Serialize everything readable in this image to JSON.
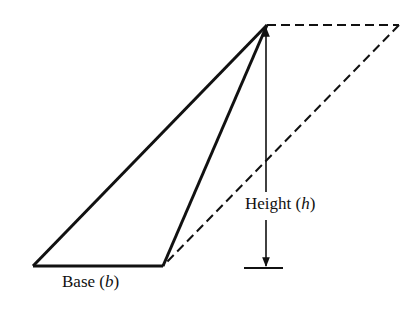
{
  "figure": {
    "colors": {
      "stroke": "#111111",
      "background": "#ffffff"
    },
    "labels": {
      "base": {
        "text": "Base",
        "var": "b"
      },
      "height": {
        "text": "Height",
        "var": "h"
      }
    },
    "shapes": {
      "triangle": {
        "points": [
          [
            33,
            266
          ],
          [
            163,
            266
          ],
          [
            267,
            25
          ]
        ]
      },
      "parallelogram_completion_dashed": {
        "points": [
          [
            267,
            25
          ],
          [
            399,
            25
          ],
          [
            163,
            266
          ]
        ]
      },
      "height_arrow": {
        "x": 266,
        "top": 25,
        "bottom": 268,
        "bar_from": 244,
        "bar_to": 283
      }
    }
  }
}
